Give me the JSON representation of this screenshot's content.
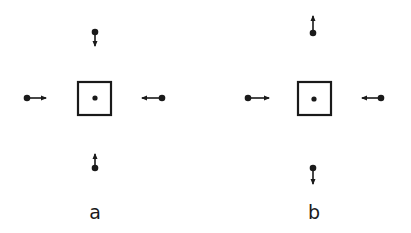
{
  "figure": {
    "width": 411,
    "height": 233,
    "ink_color": "#1a1a1a",
    "background": "#ffffff"
  },
  "panels": [
    {
      "label": "a",
      "description": "arrows point inward toward central particle (attraction)",
      "label_pos": [
        95,
        219
      ],
      "center_box": {
        "x": 78,
        "y": 82,
        "size": 33
      },
      "center_dot": [
        95,
        98
      ],
      "particles": [
        {
          "name": "top",
          "dot": [
            95,
            32
          ],
          "tip": [
            95,
            46
          ]
        },
        {
          "name": "left",
          "dot": [
            27,
            98
          ],
          "tip": [
            46,
            98
          ]
        },
        {
          "name": "right",
          "dot": [
            162,
            98
          ],
          "tip": [
            142,
            98
          ]
        },
        {
          "name": "bottom",
          "dot": [
            95,
            168
          ],
          "tip": [
            95,
            154
          ]
        }
      ]
    },
    {
      "label": "b",
      "description": "horizontal arrows point inward, vertical arrows point outward",
      "label_pos": [
        314,
        219
      ],
      "center_box": {
        "x": 298,
        "y": 82,
        "size": 33
      },
      "center_dot": [
        314,
        99
      ],
      "particles": [
        {
          "name": "top",
          "dot": [
            313,
            33
          ],
          "tip": [
            313,
            16
          ]
        },
        {
          "name": "left",
          "dot": [
            248,
            98
          ],
          "tip": [
            269,
            98
          ]
        },
        {
          "name": "right",
          "dot": [
            381,
            98
          ],
          "tip": [
            362,
            98
          ]
        },
        {
          "name": "bottom",
          "dot": [
            313,
            168
          ],
          "tip": [
            313,
            184
          ]
        }
      ]
    }
  ]
}
